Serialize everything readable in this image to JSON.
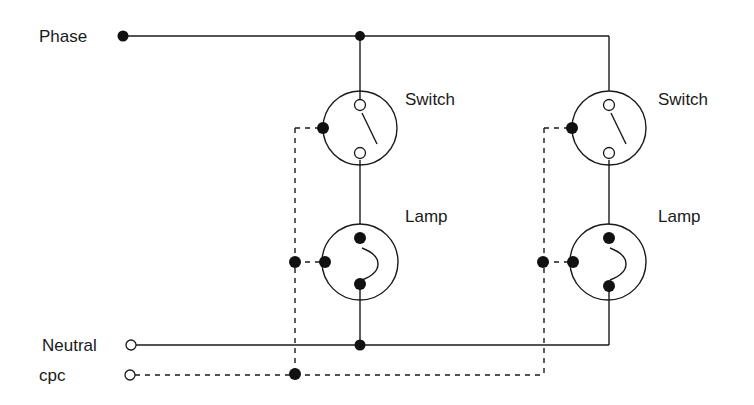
{
  "diagram": {
    "type": "wiring-schematic",
    "terminals": {
      "phase": "Phase",
      "neutral": "Neutral",
      "cpc": "cpc"
    },
    "circuits": [
      {
        "switch_label": "Switch",
        "lamp_label": "Lamp"
      },
      {
        "switch_label": "Switch",
        "lamp_label": "Lamp"
      }
    ],
    "colors": {
      "line": "#1a1a1a",
      "background": "#ffffff"
    }
  }
}
